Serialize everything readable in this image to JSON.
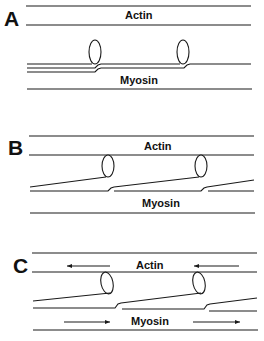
{
  "panels": [
    {
      "id": "A",
      "letter": "A",
      "actin_label": "Actin",
      "myosin_label": "Myosin",
      "arrows": false
    },
    {
      "id": "B",
      "letter": "B",
      "actin_label": "Actin",
      "myosin_label": "Myosin",
      "arrows": false
    },
    {
      "id": "C",
      "letter": "C",
      "actin_label": "Actin",
      "myosin_label": "Myosin",
      "arrows": true,
      "actin_arrow_direction": "left",
      "myosin_arrow_direction": "right"
    }
  ],
  "colors": {
    "line": "#1a1a1a",
    "background": "#ffffff"
  }
}
